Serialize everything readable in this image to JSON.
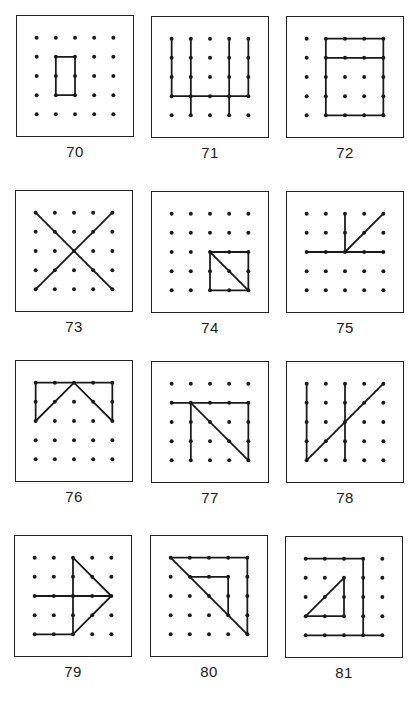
{
  "page": {
    "grid_size": 5,
    "ink_color": "#1a1a1a",
    "background": "#ffffff"
  },
  "figures": [
    {
      "number": "70",
      "segments": [
        [
          1,
          1,
          2,
          1
        ],
        [
          2,
          1,
          2,
          3
        ],
        [
          2,
          3,
          1,
          3
        ],
        [
          1,
          3,
          1,
          1
        ]
      ]
    },
    {
      "number": "71",
      "segments": [
        [
          0,
          0,
          0,
          3
        ],
        [
          1,
          0,
          1,
          4
        ],
        [
          3,
          0,
          3,
          4
        ],
        [
          4,
          0,
          4,
          3
        ],
        [
          0,
          3,
          4,
          3
        ]
      ]
    },
    {
      "number": "72",
      "segments": [
        [
          1,
          0,
          4,
          0
        ],
        [
          4,
          0,
          4,
          4
        ],
        [
          4,
          4,
          1,
          4
        ],
        [
          1,
          4,
          1,
          0
        ],
        [
          1,
          1,
          4,
          1
        ]
      ]
    },
    {
      "number": "73",
      "segments": [
        [
          0,
          0,
          4,
          4
        ],
        [
          4,
          0,
          0,
          4
        ]
      ]
    },
    {
      "number": "74",
      "segments": [
        [
          2,
          2,
          4,
          2
        ],
        [
          4,
          2,
          4,
          4
        ],
        [
          4,
          4,
          2,
          4
        ],
        [
          2,
          4,
          2,
          2
        ],
        [
          2,
          2,
          4,
          4
        ]
      ]
    },
    {
      "number": "75",
      "segments": [
        [
          0,
          2,
          4,
          2
        ],
        [
          2,
          2,
          2,
          0
        ],
        [
          2,
          2,
          4,
          0
        ]
      ]
    },
    {
      "number": "76",
      "segments": [
        [
          0,
          0,
          4,
          0
        ],
        [
          0,
          0,
          0,
          2
        ],
        [
          4,
          0,
          4,
          2
        ],
        [
          0,
          2,
          2,
          0
        ],
        [
          2,
          0,
          4,
          2
        ]
      ]
    },
    {
      "number": "77",
      "segments": [
        [
          0,
          1,
          4,
          1
        ],
        [
          1,
          1,
          1,
          4
        ],
        [
          4,
          1,
          4,
          4
        ],
        [
          1,
          1,
          4,
          4
        ]
      ]
    },
    {
      "number": "78",
      "segments": [
        [
          0,
          0,
          0,
          4
        ],
        [
          2,
          0,
          2,
          4
        ],
        [
          0,
          4,
          4,
          0
        ]
      ]
    },
    {
      "number": "79",
      "segments": [
        [
          2,
          0,
          2,
          4
        ],
        [
          0,
          2,
          4,
          2
        ],
        [
          2,
          0,
          4,
          2
        ],
        [
          4,
          2,
          2,
          4
        ],
        [
          2,
          4,
          0,
          4
        ]
      ]
    },
    {
      "number": "80",
      "segments": [
        [
          0,
          0,
          4,
          0
        ],
        [
          4,
          0,
          4,
          4
        ],
        [
          0,
          0,
          4,
          4
        ],
        [
          1,
          1,
          3,
          1
        ],
        [
          3,
          1,
          3,
          3
        ]
      ]
    },
    {
      "number": "81",
      "segments": [
        [
          0,
          0,
          3,
          0
        ],
        [
          3,
          0,
          3,
          4
        ],
        [
          0,
          4,
          4,
          4
        ],
        [
          2,
          1,
          2,
          3
        ],
        [
          2,
          3,
          0,
          3
        ],
        [
          0,
          3,
          2,
          1
        ]
      ]
    }
  ],
  "layout": {
    "positions": [
      [
        16,
        15
      ],
      [
        151,
        16
      ],
      [
        286,
        16
      ],
      [
        15,
        190
      ],
      [
        151,
        191
      ],
      [
        286,
        191
      ],
      [
        15,
        360
      ],
      [
        151,
        361
      ],
      [
        286,
        361
      ],
      [
        14,
        535
      ],
      [
        150,
        535
      ],
      [
        285,
        536
      ]
    ]
  }
}
